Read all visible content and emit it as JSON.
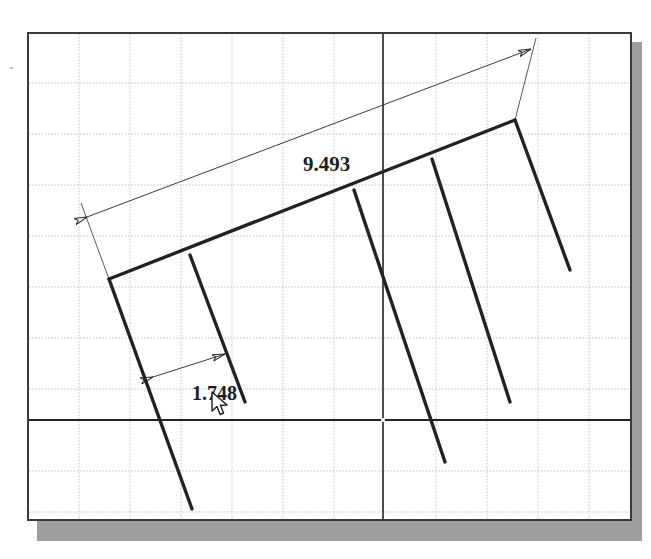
{
  "app": {
    "title": "CAD Sketch Canvas",
    "kind": "2d-sketch-drawing"
  },
  "canvas": {
    "background_color": "#ffffff",
    "sheet_border_color": "#3a3a3a",
    "shadow_color": "#9e9e9e",
    "grid": {
      "enabled": true,
      "minor_color": "#c9c9c9",
      "spacing_px": 51,
      "style": "dashed"
    },
    "axes": {
      "color": "#2b2b2b",
      "origin_label": "",
      "horizontal_y_px": 418,
      "vertical_x_px": 381
    }
  },
  "geometry": {
    "line_color": "#262626",
    "spine": {
      "name": "rake-spine",
      "x1": 107,
      "y1": 277,
      "x2": 513,
      "y2": 118
    },
    "teeth": [
      {
        "name": "tooth-1",
        "x1": 107,
        "y1": 277,
        "x2": 190,
        "y2": 507
      },
      {
        "name": "tooth-2",
        "x1": 188,
        "y1": 253,
        "x2": 243,
        "y2": 400
      },
      {
        "name": "tooth-3",
        "x1": 352,
        "y1": 188,
        "x2": 443,
        "y2": 460
      },
      {
        "name": "tooth-4",
        "x1": 430,
        "y1": 157,
        "x2": 508,
        "y2": 400
      },
      {
        "name": "tooth-5",
        "x1": 513,
        "y1": 118,
        "x2": 568,
        "y2": 268
      }
    ]
  },
  "dimensions": [
    {
      "id": "dim-a",
      "name": "overall-length-dimension",
      "value": "9.493",
      "arrow_style": "double-arrow",
      "leader": {
        "x1": 85,
        "y1": 215,
        "x2": 513,
        "y2": 47
      },
      "ext_left": {
        "x1": 107,
        "y1": 277,
        "x2": 79,
        "y2": 201
      },
      "ext_right": {
        "x1": 513,
        "y1": 118,
        "x2": 534,
        "y2": 36
      }
    },
    {
      "id": "dim-b",
      "name": "tooth-spacing-dimension",
      "value": "1.748",
      "arrow_style": "double-arrow",
      "leader": {
        "x1": 151,
        "y1": 375,
        "x2": 223,
        "y2": 352
      }
    }
  ],
  "cursor": {
    "name": "mouse-pointer",
    "type": "arrow",
    "x": 182,
    "y": 357
  }
}
